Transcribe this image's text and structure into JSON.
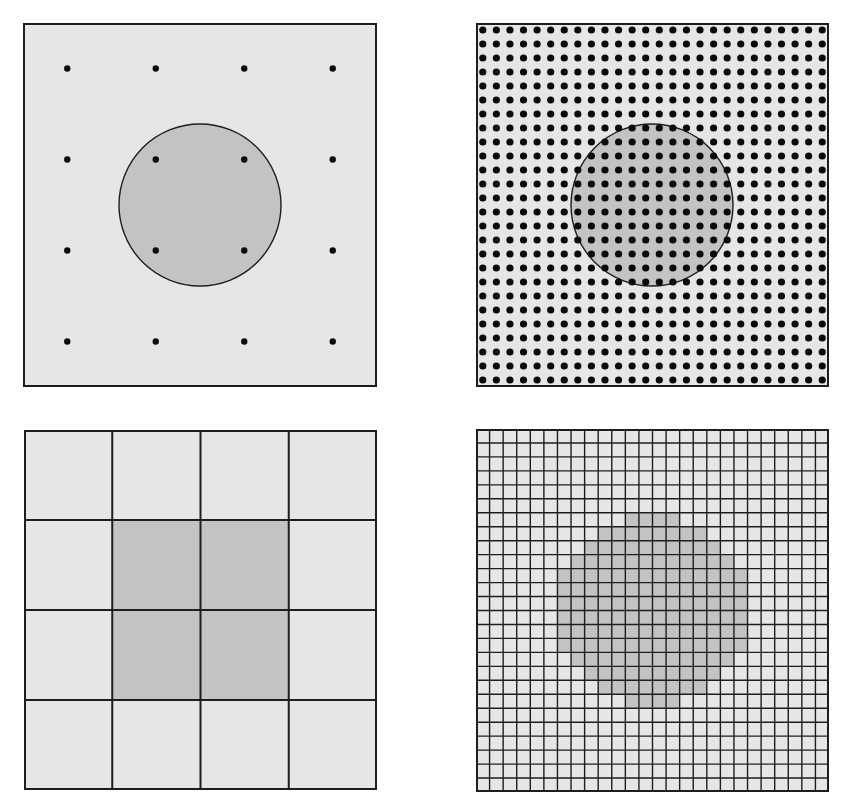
{
  "figure": {
    "width": 842,
    "height": 809
  },
  "colors": {
    "background": "#e6e6e6",
    "shape_fill": "#c3c3c3",
    "outline": "#1e1e1e",
    "dot": "#0a0a0a",
    "grid_line": "#1e1e1e"
  },
  "panels": [
    {
      "id": "coarse-point-sampling",
      "type": "points",
      "x": 23,
      "y": 23,
      "width": 354,
      "height": 364,
      "border_width": 2,
      "n_cols": 4,
      "n_rows": 4,
      "dot_radius": 3.2,
      "circle": {
        "cx": 177,
        "cy": 182,
        "r": 81
      }
    },
    {
      "id": "fine-point-sampling",
      "type": "points",
      "x": 476,
      "y": 23,
      "width": 353,
      "height": 364,
      "border_width": 2,
      "n_cols": 26,
      "n_rows": 26,
      "dot_radius": 3.6,
      "circle": {
        "cx": 176,
        "cy": 182,
        "r": 81
      }
    },
    {
      "id": "coarse-pixel-grid",
      "type": "cells",
      "x": 24,
      "y": 430,
      "width": 353,
      "height": 360,
      "border_width": 2,
      "line_width": 2,
      "n_cols": 4,
      "n_rows": 4,
      "filled_rows": [
        [],
        [
          [
            1,
            2
          ]
        ],
        [
          [
            1,
            2
          ]
        ],
        []
      ]
    },
    {
      "id": "fine-pixel-grid",
      "type": "cells",
      "x": 476,
      "y": 429,
      "width": 353,
      "height": 363,
      "border_width": 2,
      "line_width": 1.4,
      "n_cols": 26,
      "n_rows": 26,
      "filled_rows": [
        [],
        [],
        [],
        [],
        [],
        [],
        [
          [
            11,
            14
          ]
        ],
        [
          [
            9,
            16
          ]
        ],
        [
          [
            8,
            17
          ]
        ],
        [
          [
            7,
            18
          ]
        ],
        [
          [
            6,
            19
          ]
        ],
        [
          [
            6,
            19
          ]
        ],
        [
          [
            6,
            19
          ]
        ],
        [
          [
            6,
            19
          ]
        ],
        [
          [
            6,
            19
          ]
        ],
        [
          [
            6,
            19
          ]
        ],
        [
          [
            7,
            18
          ]
        ],
        [
          [
            8,
            17
          ]
        ],
        [
          [
            9,
            16
          ]
        ],
        [
          [
            11,
            14
          ]
        ],
        [],
        [],
        [],
        [],
        [],
        []
      ]
    }
  ]
}
